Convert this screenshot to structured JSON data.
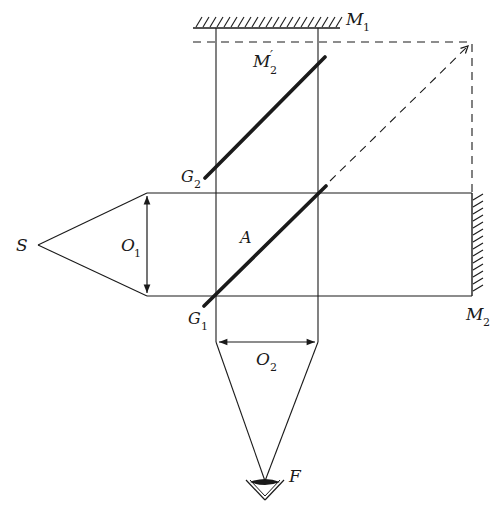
{
  "diagram": {
    "colors": {
      "ink": "#1a1a1a",
      "background": "#ffffff"
    },
    "labels": {
      "source": {
        "main": "S",
        "sub": ""
      },
      "lens1": {
        "main": "O",
        "sub": "1"
      },
      "lens2": {
        "main": "O",
        "sub": "2"
      },
      "mirror1": {
        "main": "M",
        "sub": "1"
      },
      "mirror2": {
        "main": "M",
        "sub": "2"
      },
      "mirror2_image": {
        "main": "M",
        "sub": "2",
        "prime": "′"
      },
      "beamsplitter": {
        "main": "A",
        "sub": ""
      },
      "plate1": {
        "main": "G",
        "sub": "1"
      },
      "plate2": {
        "main": "G",
        "sub": "2"
      },
      "observer": {
        "main": "F",
        "sub": ""
      }
    },
    "elements": [
      {
        "id": "source",
        "type": "point-source",
        "label": "S"
      },
      {
        "id": "lens1",
        "type": "collimating-lens",
        "label": "O1"
      },
      {
        "id": "beamsplitter",
        "type": "half-silvered-plate",
        "label": "A"
      },
      {
        "id": "plate1",
        "type": "plate-edge",
        "label": "G1"
      },
      {
        "id": "plate2",
        "type": "compensating-plate",
        "label": "G2"
      },
      {
        "id": "mirror1",
        "type": "mirror",
        "label": "M1"
      },
      {
        "id": "mirror2",
        "type": "mirror",
        "label": "M2"
      },
      {
        "id": "mirror2_image",
        "type": "virtual-mirror",
        "label": "M2'"
      },
      {
        "id": "lens2",
        "type": "focusing-lens",
        "label": "O2"
      },
      {
        "id": "observer",
        "type": "eye",
        "label": "F"
      }
    ]
  }
}
